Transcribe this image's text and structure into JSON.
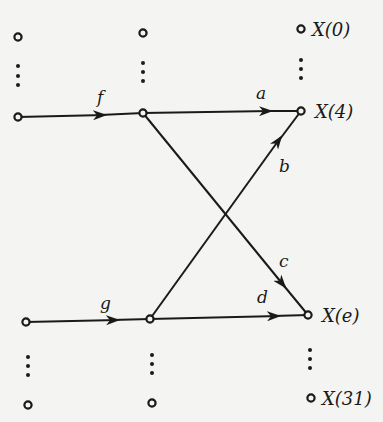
{
  "diagram": {
    "type": "signal-flow-graph",
    "colors": {
      "line": "#1a1a1a",
      "background": "#f4f4f2"
    },
    "outputs": [
      {
        "id": "x0",
        "label": "X(0)"
      },
      {
        "id": "x4",
        "label": "X(4)"
      },
      {
        "id": "xe",
        "label": "X(e)"
      },
      {
        "id": "x31",
        "label": "X(31)"
      }
    ],
    "branches": [
      {
        "id": "f",
        "label": "f",
        "from": "col1-row4",
        "to": "col2-row4"
      },
      {
        "id": "g",
        "label": "g",
        "from": "col1-rowe",
        "to": "col2-rowe"
      },
      {
        "id": "a",
        "label": "a",
        "from": "col2-row4",
        "to": "X(4)"
      },
      {
        "id": "b",
        "label": "b",
        "from": "col2-rowe",
        "to": "X(4)"
      },
      {
        "id": "c",
        "label": "c",
        "from": "col2-row4",
        "to": "X(e)"
      },
      {
        "id": "d",
        "label": "d",
        "from": "col2-rowe",
        "to": "X(e)"
      }
    ]
  }
}
